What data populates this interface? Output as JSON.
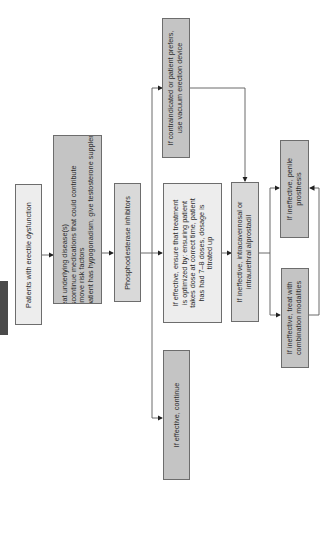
{
  "diagram": {
    "orientation": "rotated-90-ccw",
    "colors": {
      "box_light": "#ededed",
      "box_mid": "#d9d9d9",
      "box_dark": "#c4c4c4",
      "border": "#6d6d6d",
      "tab": "#4a4a4a",
      "line": "#5a5a5a"
    },
    "nodes": {
      "start": {
        "label": "Patients with erectile dysfunction"
      },
      "initial_steps": {
        "items": [
          {
            "num": "1.",
            "text": "Treat underlying disease(s)"
          },
          {
            "num": "2.",
            "text": "Discontinue medications that could contribute"
          },
          {
            "num": "3.",
            "text": "Remove risk factors"
          },
          {
            "num": "4.",
            "text": "If patient has hypogonadism, give testosterone supplements"
          }
        ]
      },
      "pde_inhibitors": {
        "label": "Phosphodiesterase inhibitors"
      },
      "vacuum_device": {
        "lines": [
          "If contraindicated or patient prefers,",
          "use vacuum erection device"
        ]
      },
      "optimize": {
        "lines": [
          "If effective, ensure that treatment",
          "is optimized by: ensuring patient",
          "takes dose at correct time, patient",
          "has had 7–8 doses, dosage is",
          "titrated up"
        ]
      },
      "continue": {
        "label": "If effective, continue"
      },
      "alprostadil": {
        "lines": [
          "If ineffective, intracavernosal or",
          "intraurethral alprostadil"
        ]
      },
      "prosthesis": {
        "lines": [
          "If ineffective, penile",
          "prosthesis"
        ]
      },
      "combination": {
        "lines": [
          "If ineffective, treat with",
          "combination modalities"
        ]
      }
    }
  }
}
